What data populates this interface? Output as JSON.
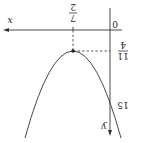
{
  "diagram": {
    "type": "parabola-graph",
    "orientation": "rotated 180 degrees",
    "axes": {
      "x_label": "x",
      "y_label": "y",
      "origin_label": "0"
    },
    "vertex": {
      "x_label": "7/2",
      "x_num": "7",
      "x_den": "2",
      "y_label": "11/4",
      "y_num": "11",
      "y_den": "4"
    },
    "y_intercept_label": "15",
    "colors": {
      "line": "#333333",
      "background": "#ffffff"
    }
  }
}
